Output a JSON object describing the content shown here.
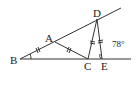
{
  "diagram": {
    "type": "geometry",
    "points": {
      "A": {
        "label": "A",
        "x": 55,
        "y": 42
      },
      "B": {
        "label": "B",
        "x": 20,
        "y": 59
      },
      "C": {
        "label": "C",
        "x": 88,
        "y": 59
      },
      "D": {
        "label": "D",
        "x": 97,
        "y": 19
      },
      "E": {
        "label": "E",
        "x": 102,
        "y": 59
      }
    },
    "segments": [
      "BD-ray",
      "BE-ray",
      "AC",
      "CD",
      "DE"
    ],
    "equal_marks": [
      "BA",
      "AC",
      "CD",
      "DE"
    ],
    "angle_label": "78°",
    "angle_at": "E",
    "marked_angle_at": "B"
  }
}
